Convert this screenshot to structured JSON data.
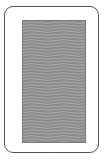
{
  "card": {
    "face": "back",
    "pattern": "wavy-lines",
    "colors": {
      "border": "#555555",
      "background": "#ffffff",
      "pattern_base": "#8c8c8c",
      "wave_dark": "#7a7a7a",
      "wave_light": "#a8a8a8"
    }
  },
  "caption": {
    "text": "· ·"
  }
}
